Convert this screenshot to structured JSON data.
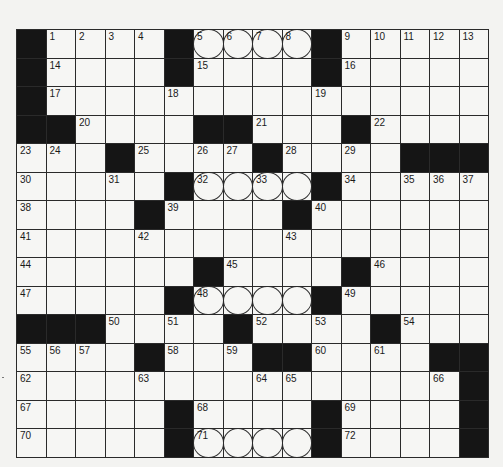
{
  "puzzle": {
    "rows": 15,
    "cols": 16,
    "legend": {
      "#": "black",
      ".": "white",
      "O": "circled"
    },
    "grid": [
      "#....#OOOO#.....",
      "#....#....#.....",
      "#...............",
      "##....##...#....",
      "...#....#....###",
      ".....#OOOO#.....",
      "....#....#......",
      "................",
      "......#....#....",
      ".....#OOOO#.....",
      "###....#....#...",
      "....#...##....##",
      "...............#",
      ".....#....#....#",
      ".....#OOOO#....#"
    ],
    "numbers": [
      [
        0,
        1,
        1
      ],
      [
        0,
        2,
        2
      ],
      [
        0,
        3,
        3
      ],
      [
        0,
        4,
        4
      ],
      [
        0,
        6,
        5
      ],
      [
        0,
        7,
        6
      ],
      [
        0,
        8,
        7
      ],
      [
        0,
        9,
        8
      ],
      [
        0,
        11,
        9
      ],
      [
        0,
        12,
        10
      ],
      [
        0,
        13,
        11
      ],
      [
        0,
        14,
        12
      ],
      [
        0,
        15,
        13
      ],
      [
        1,
        1,
        14
      ],
      [
        1,
        6,
        15
      ],
      [
        1,
        11,
        16
      ],
      [
        2,
        1,
        17
      ],
      [
        2,
        5,
        18
      ],
      [
        2,
        10,
        19
      ],
      [
        3,
        2,
        20
      ],
      [
        3,
        8,
        21
      ],
      [
        3,
        12,
        22
      ],
      [
        4,
        0,
        23
      ],
      [
        4,
        1,
        24
      ],
      [
        4,
        4,
        25
      ],
      [
        4,
        6,
        26
      ],
      [
        4,
        7,
        27
      ],
      [
        4,
        9,
        28
      ],
      [
        4,
        11,
        29
      ],
      [
        5,
        0,
        30
      ],
      [
        5,
        3,
        31
      ],
      [
        5,
        6,
        32
      ],
      [
        5,
        8,
        33
      ],
      [
        5,
        11,
        34
      ],
      [
        5,
        13,
        35
      ],
      [
        5,
        14,
        36
      ],
      [
        5,
        15,
        37
      ],
      [
        6,
        0,
        38
      ],
      [
        6,
        5,
        39
      ],
      [
        6,
        10,
        40
      ],
      [
        7,
        0,
        41
      ],
      [
        7,
        4,
        42
      ],
      [
        7,
        9,
        43
      ],
      [
        8,
        0,
        44
      ],
      [
        8,
        7,
        45
      ],
      [
        8,
        12,
        46
      ],
      [
        9,
        0,
        47
      ],
      [
        9,
        6,
        48
      ],
      [
        9,
        11,
        49
      ],
      [
        10,
        3,
        50
      ],
      [
        10,
        5,
        51
      ],
      [
        10,
        8,
        52
      ],
      [
        10,
        10,
        53
      ],
      [
        10,
        13,
        54
      ],
      [
        11,
        0,
        55
      ],
      [
        11,
        1,
        56
      ],
      [
        11,
        2,
        57
      ],
      [
        11,
        5,
        58
      ],
      [
        11,
        7,
        59
      ],
      [
        11,
        10,
        60
      ],
      [
        11,
        12,
        61
      ],
      [
        12,
        0,
        62
      ],
      [
        12,
        4,
        63
      ],
      [
        12,
        8,
        64
      ],
      [
        12,
        9,
        65
      ],
      [
        12,
        14,
        66
      ],
      [
        13,
        0,
        67
      ],
      [
        13,
        6,
        68
      ],
      [
        13,
        11,
        69
      ],
      [
        14,
        0,
        70
      ],
      [
        14,
        6,
        71
      ],
      [
        14,
        11,
        72
      ]
    ]
  },
  "colors": {
    "black_square": "#151515",
    "white_square": "#f6f6f4",
    "grid_line": "#2a2a2a",
    "background": "#f3f3f1"
  }
}
